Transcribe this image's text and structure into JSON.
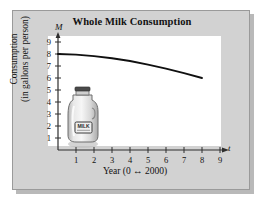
{
  "figure": {
    "title": "Whole Milk Consumption",
    "panel_color": "#d2d2d2",
    "plot_color": "#ffffff",
    "curve_color": "#101010",
    "axis_color": "#3a3a3a",
    "illustration": {
      "name": "milk-jug",
      "label_text": "MILK"
    }
  },
  "chart_data": {
    "type": "line",
    "title": "Whole Milk Consumption",
    "xlabel": "Year (0 ↔ 2000)",
    "ylabel": "Consumption (in gallons per person)",
    "ylabel_line1": "Consumption",
    "ylabel_line2": "(in gallons per person)",
    "x_axis_variable": "t",
    "y_axis_variable": "M",
    "xlim": [
      0,
      9.6
    ],
    "ylim": [
      0,
      9.6
    ],
    "xticks": [
      1,
      2,
      3,
      4,
      5,
      6,
      7,
      8,
      9
    ],
    "yticks": [
      1,
      2,
      3,
      4,
      5,
      6,
      7,
      8,
      9
    ],
    "xtick_labels": [
      "1",
      "2",
      "3",
      "4",
      "5",
      "6",
      "7",
      "8",
      "9"
    ],
    "ytick_labels": [
      "1",
      "2",
      "3",
      "4",
      "5",
      "6",
      "7",
      "8",
      "9"
    ],
    "grid": false,
    "legend": false,
    "series": [
      {
        "name": "Whole milk consumption",
        "x": [
          0,
          1,
          2,
          3,
          4,
          5,
          6,
          7,
          8
        ],
        "values": [
          8.0,
          7.95,
          7.82,
          7.65,
          7.42,
          7.12,
          6.78,
          6.4,
          6.0
        ]
      }
    ]
  }
}
